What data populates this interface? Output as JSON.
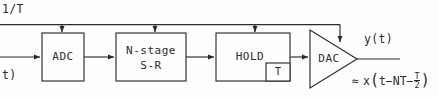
{
  "diagram": {
    "stroke_color": "#2b2b2b",
    "background_color": "#fefefe"
  },
  "signals": {
    "clock_label": "1/T",
    "input_label": "t)",
    "output_label": "y(t)"
  },
  "blocks": [
    {
      "name": "adc",
      "label": "ADC"
    },
    {
      "name": "shift-register",
      "label_line1": "N-stage",
      "label_line2": "S-R"
    },
    {
      "name": "hold",
      "label": "HOLD"
    },
    {
      "name": "delay-tap",
      "label": "T"
    },
    {
      "name": "dac",
      "label": "DAC"
    }
  ],
  "equation": {
    "approx_symbol": "≈",
    "func": "x",
    "open_paren": "(",
    "term1": "t−NT−",
    "frac_num": "T",
    "frac_den": "2",
    "close_paren": ")"
  }
}
